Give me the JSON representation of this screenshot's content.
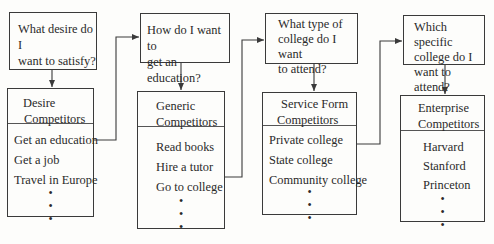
{
  "columns": [
    {
      "question": [
        "What desire do I",
        "want to satisfy?"
      ],
      "competitor_type": [
        "Desire",
        "Competitors"
      ],
      "items": [
        "Get an education",
        "Get a job",
        "Travel in Europe"
      ],
      "ellipsis": [
        "•",
        "•",
        "•"
      ]
    },
    {
      "question": [
        "How do I want to",
        "get an education?"
      ],
      "competitor_type": [
        "Generic",
        "Competitors"
      ],
      "items": [
        "Read books",
        "Hire a tutor",
        "Go to college"
      ],
      "ellipsis": [
        "•",
        "•",
        "•"
      ]
    },
    {
      "question": [
        "What type of",
        "college do I want",
        "to attend?"
      ],
      "competitor_type": [
        "Service Form",
        "Competitors"
      ],
      "items": [
        "Private college",
        "State college",
        "Community college"
      ],
      "ellipsis": [
        "•",
        "•",
        "•"
      ]
    },
    {
      "question": [
        "Which specific",
        "college do I",
        "want to attend?"
      ],
      "competitor_type": [
        "Enterprise",
        "Competitors"
      ],
      "items": [
        "Harvard",
        "Stanford",
        "Princeton"
      ],
      "ellipsis": [
        "•",
        "•",
        "•"
      ]
    }
  ],
  "colors": {
    "line": "#3a3a3a",
    "background": "#fdfdfb",
    "text": "#2a2a2a"
  }
}
